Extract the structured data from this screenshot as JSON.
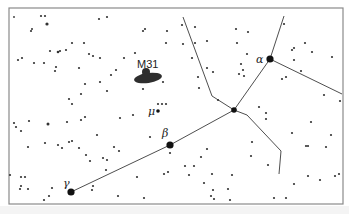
{
  "diagram": {
    "frame": {
      "x": 9,
      "y": 8,
      "w": 334,
      "h": 196
    },
    "colors": {
      "background": "#ffffff",
      "stars": "#333333",
      "lines": "#3a3a3a",
      "frame": "#8a8a8a"
    },
    "labels": {
      "m31": "M31",
      "alpha": "α",
      "beta": "β",
      "gamma": "γ",
      "mu": "μ"
    },
    "named_stars": [
      {
        "name": "alpha",
        "x": 270,
        "y": 59,
        "r": 3.6
      },
      {
        "name": "beta",
        "x": 170,
        "y": 145,
        "r": 3.6
      },
      {
        "name": "gamma",
        "x": 71,
        "y": 192,
        "r": 3.6
      },
      {
        "name": "delta",
        "x": 234,
        "y": 110,
        "r": 2.8
      },
      {
        "name": "mu",
        "x": 158,
        "y": 111,
        "r": 1.8
      }
    ],
    "constellation_lines": [
      [
        71,
        192,
        170,
        145
      ],
      [
        170,
        145,
        234,
        110
      ],
      [
        234,
        110,
        270,
        59
      ],
      [
        270,
        59,
        284,
        16
      ],
      [
        270,
        59,
        342,
        94
      ],
      [
        234,
        110,
        212,
        96
      ],
      [
        212,
        96,
        183,
        17
      ],
      [
        234,
        110,
        247,
        115
      ],
      [
        247,
        115,
        281,
        151
      ],
      [
        281,
        151,
        279,
        174
      ]
    ],
    "galaxy": {
      "name": "M31",
      "cx": 148,
      "cy": 78,
      "rx": 14,
      "ry": 5,
      "bulge_cx": 146,
      "bulge_cy": 72,
      "bulge_r": 4
    }
  }
}
